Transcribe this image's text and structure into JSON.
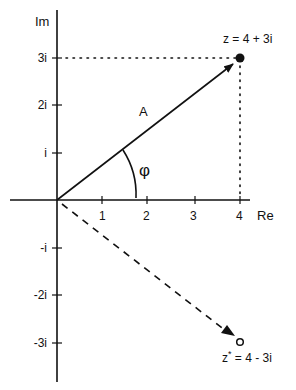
{
  "axes": {
    "real_label": "Re",
    "imag_label": "Im",
    "real_ticks": [
      "1",
      "2",
      "3",
      "4"
    ],
    "imag_ticks_pos": [
      "i",
      "2i",
      "3i"
    ],
    "imag_ticks_neg": [
      "-i",
      "-2i",
      "-3i"
    ]
  },
  "vectors": {
    "z": {
      "label": "z = 4 + 3i",
      "re": 4,
      "im": 3,
      "style": "solid",
      "marker": "filled-dot"
    },
    "z_conj": {
      "label_base": "z",
      "label_sup": "*",
      "label_rest": " = 4 - 3i",
      "re": 4,
      "im": -3,
      "style": "dashed",
      "marker": "open-circle"
    }
  },
  "labels": {
    "magnitude": "A",
    "angle": "φ"
  },
  "colors": {
    "ink": "#111111",
    "background": "#ffffff"
  }
}
